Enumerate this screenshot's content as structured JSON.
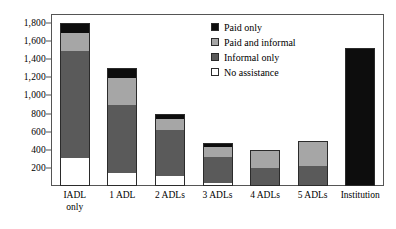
{
  "chart_data": {
    "type": "bar",
    "stacked": true,
    "title": "",
    "subtitle": "",
    "xlabel": "",
    "ylabel": "",
    "ylim": [
      0,
      1900
    ],
    "yticks": [
      200,
      400,
      600,
      800,
      1000,
      1200,
      1400,
      1600,
      1800
    ],
    "ytick_labels": [
      "200",
      "400",
      "600",
      "800",
      "1,000",
      "1,200",
      "1,400",
      "1,600",
      "1,800"
    ],
    "grid": false,
    "legend_position": "upper-right-inside",
    "categories": [
      "IADL\nonly",
      "1 ADL",
      "2 ADLs",
      "3 ADLs",
      "4 ADLs",
      "5 ADLs",
      "Institution"
    ],
    "category_labels_flat": [
      "IADL only",
      "1 ADL",
      "2 ADLs",
      "3 ADLs",
      "4 ADLs",
      "5 ADLs",
      "Institution"
    ],
    "series": [
      {
        "name": "No assistance",
        "color": "#ffffff",
        "values": [
          300,
          140,
          100,
          20,
          0,
          0,
          0
        ]
      },
      {
        "name": "Informal only",
        "color": "#5a5a5a",
        "values": [
          1200,
          760,
          520,
          300,
          200,
          215,
          0
        ]
      },
      {
        "name": "Paid and informal",
        "color": "#a6a6a6",
        "values": [
          200,
          300,
          130,
          120,
          200,
          285,
          0
        ]
      },
      {
        "name": "Paid only",
        "color": "#0d0d0d",
        "values": [
          100,
          100,
          50,
          30,
          0,
          0,
          1530
        ]
      }
    ],
    "totals": [
      1800,
      1300,
      800,
      470,
      400,
      500,
      1530
    ]
  },
  "legend": {
    "items": [
      {
        "label": "Paid only",
        "color": "#0d0d0d"
      },
      {
        "label": "Paid and informal",
        "color": "#a6a6a6"
      },
      {
        "label": "Informal only",
        "color": "#5a5a5a"
      },
      {
        "label": "No assistance",
        "color": "#ffffff"
      }
    ]
  }
}
